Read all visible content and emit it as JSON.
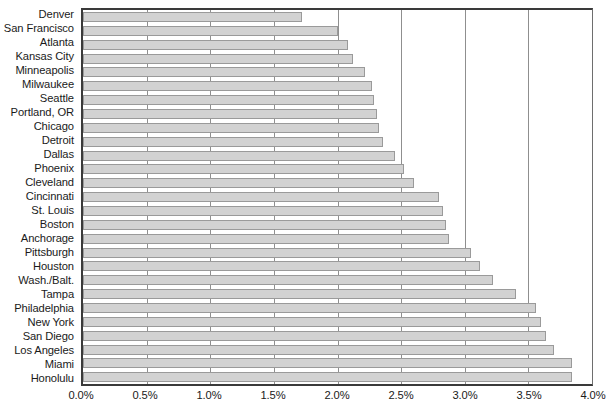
{
  "chart_data": {
    "type": "bar",
    "orientation": "horizontal",
    "title": "",
    "subtitle": "",
    "xlabel": "",
    "ylabel": "",
    "xlim": [
      0,
      4.0
    ],
    "xtick_labels": [
      "0.0%",
      "0.5%",
      "1.0%",
      "1.5%",
      "2.0%",
      "2.5%",
      "3.0%",
      "3.5%",
      "4.0%"
    ],
    "xtick_values": [
      0,
      0.5,
      1.0,
      1.5,
      2.0,
      2.5,
      3.0,
      3.5,
      4.0
    ],
    "grid": true,
    "grid_axis": "x",
    "legend": null,
    "unit": "%",
    "bar_color": "#d2d2d2",
    "bar_border_color": "#9a9a9a",
    "axis_color": "#3a3a3a",
    "gridline_color": "#8f8f8f",
    "categories": [
      "Denver",
      "San Francisco",
      "Atlanta",
      "Kansas City",
      "Minneapolis",
      "Milwaukee",
      "Seattle",
      "Portland, OR",
      "Chicago",
      "Detroit",
      "Dallas",
      "Phoenix",
      "Cleveland",
      "Cincinnati",
      "St. Louis",
      "Boston",
      "Anchorage",
      "Pittsburgh",
      "Houston",
      "Wash./Balt.",
      "Tampa",
      "Philadelphia",
      "New York",
      "San Diego",
      "Los Angeles",
      "Miami",
      "Honolulu"
    ],
    "values": [
      1.72,
      2.0,
      2.08,
      2.12,
      2.22,
      2.27,
      2.29,
      2.31,
      2.33,
      2.36,
      2.45,
      2.52,
      2.6,
      2.8,
      2.83,
      2.85,
      2.88,
      3.05,
      3.12,
      3.22,
      3.4,
      3.56,
      3.6,
      3.64,
      3.7,
      3.84,
      3.84
    ]
  }
}
